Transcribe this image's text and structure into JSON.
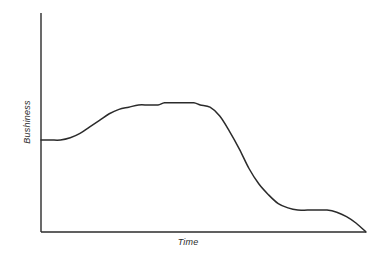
{
  "chart_data": {
    "type": "line",
    "title": "",
    "subtitle": "",
    "xlabel": "Time",
    "ylabel": "Bushiness",
    "grid": false,
    "legend": false,
    "legend_position": "none",
    "axis_ticks": false,
    "tick_labels_x": [],
    "tick_labels_y": [],
    "xlim": [
      0,
      100
    ],
    "ylim": [
      0,
      100
    ],
    "annotations": [],
    "series": [
      {
        "name": "Bushiness over time",
        "color": "#2b2b2b",
        "x": [
          0,
          3,
          6,
          9,
          12,
          15,
          18,
          21,
          24,
          27,
          30,
          33,
          36,
          38,
          41,
          44,
          47,
          49,
          52,
          55,
          58,
          61,
          64,
          67,
          70,
          73,
          76,
          79,
          82,
          85,
          88,
          91,
          94,
          97,
          100
        ],
        "y": [
          42,
          42,
          42,
          43,
          45,
          48,
          51,
          54,
          56,
          57,
          58,
          58,
          58,
          59,
          59,
          59,
          59,
          58,
          57,
          53,
          46,
          38,
          29,
          22,
          17,
          13,
          11,
          10,
          10,
          10,
          10,
          9,
          7,
          4,
          0
        ]
      }
    ]
  },
  "axes": {
    "y_axis_label": "Bushiness",
    "x_axis_label": "Time",
    "line_color": "#2b2b2b"
  },
  "colors": {
    "background": "#ffffff",
    "curve": "#2b2b2b",
    "axis": "#2b2b2b"
  }
}
